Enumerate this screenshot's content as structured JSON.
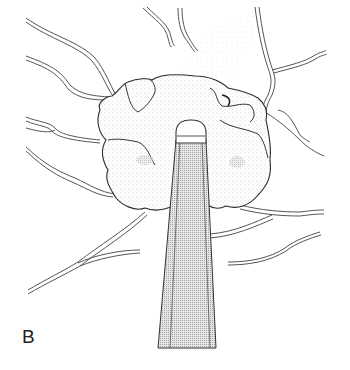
{
  "figure": {
    "panel_label": "B",
    "colors": {
      "background": "#ffffff",
      "ink": "#2a2a2a",
      "vessel": "#555555",
      "stipple": "#9a9a9a"
    },
    "elements": {
      "probe": "probe-instrument",
      "mass": "stippled-tissue-mass",
      "vessels": "branching-vessels",
      "plume": "smoke-plume"
    }
  }
}
